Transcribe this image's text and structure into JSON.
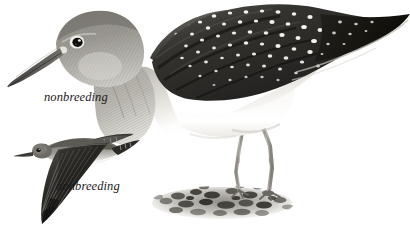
{
  "plate": {
    "background_color": "#ffffff",
    "width": 410,
    "height": 228,
    "subject_common_name": "Solitary Sandpiper",
    "illustration_style": "field-guide watercolor"
  },
  "labels": {
    "standing_bird": "nonbreeding",
    "flying_bird": "nonbreeding"
  },
  "figures": [
    {
      "id": "standing-bird",
      "pose": "standing",
      "label": "nonbreeding",
      "parts": [
        "bill",
        "head",
        "eye",
        "eye-ring",
        "neck",
        "breast",
        "mantle",
        "wing",
        "scapulars",
        "belly",
        "flank",
        "tail",
        "legs",
        "feet"
      ],
      "plumage_notes": "dark olive-brown upperparts with dense white spotting, grey streaked head and neck, white belly"
    },
    {
      "id": "flying-bird",
      "pose": "flying",
      "label": "nonbreeding",
      "parts": [
        "bill",
        "head",
        "eye",
        "body",
        "near-wing",
        "far-wing",
        "underwing",
        "tail"
      ],
      "plumage_notes": "dark upperwings and blackish underwings, white lower belly, short barred tail"
    }
  ],
  "ground": {
    "description": "mud and pebble patch beneath standing bird",
    "pebble_count": 26
  },
  "palette": {
    "background": "#ffffff",
    "darkest": "#1a1a1a",
    "dark_wing": "#2e2c29",
    "mid_grey": "#7d7b76",
    "light_grey": "#c9c7c2",
    "pale_warm": "#e6e3dd",
    "spot_white": "#fbfbf9",
    "bill": "#4e4d4a",
    "leg": "#a8a49c",
    "ground": "#9a978f"
  }
}
